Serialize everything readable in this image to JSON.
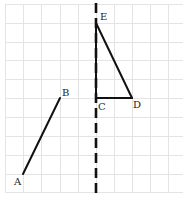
{
  "diagram": {
    "grid": {
      "x_lines": [
        5,
        23,
        41,
        60,
        78,
        96,
        114,
        132,
        150,
        168
      ],
      "y_lines": [
        4,
        23,
        42,
        60,
        79,
        98,
        117,
        136,
        155,
        174,
        192
      ],
      "x_range": [
        5,
        183
      ],
      "y_range": [
        4,
        193
      ],
      "color": "#e4e4e4"
    },
    "axis": {
      "x": 96,
      "y1": 3,
      "y2": 196,
      "style": "dashed",
      "dash": "10,5",
      "color": "#111111"
    },
    "points": {
      "A": {
        "label": "A",
        "x": 23,
        "y": 174
      },
      "B": {
        "label": "B",
        "x": 60,
        "y": 98
      },
      "C": {
        "label": "C",
        "x": 96,
        "y": 98
      },
      "D": {
        "label": "D",
        "x": 132,
        "y": 98
      },
      "E": {
        "label": "E",
        "x": 96,
        "y": 23
      }
    },
    "segments": [
      {
        "from": "A",
        "to": "B"
      },
      {
        "from": "C",
        "to": "D"
      },
      {
        "from": "D",
        "to": "E"
      },
      {
        "from": "E",
        "to": "C"
      }
    ],
    "labels": [
      {
        "text": "A",
        "x": 14,
        "y": 185
      },
      {
        "text": "B",
        "x": 62,
        "y": 96
      },
      {
        "text": "C",
        "x": 98,
        "y": 110
      },
      {
        "text": "D",
        "x": 133,
        "y": 108
      },
      {
        "text": "E",
        "x": 100,
        "y": 20
      }
    ]
  }
}
